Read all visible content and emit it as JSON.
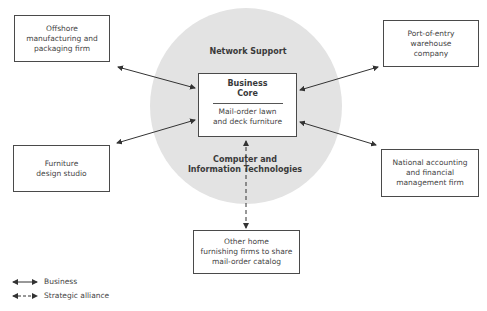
{
  "diagram": {
    "network_support_label": "Network Support",
    "core": {
      "title_line1": "Business",
      "title_line2": "Core",
      "subtitle_line1": "Mail-order lawn",
      "subtitle_line2": "and deck furniture"
    },
    "tech_label_line1": "Computer and",
    "tech_label_line2": "Information Technologies",
    "partners": [
      {
        "id": "offshore",
        "lines": [
          "Offshore",
          "manufacturing and",
          "packaging firm"
        ],
        "relationship": "business"
      },
      {
        "id": "port",
        "lines": [
          "Port-of-entry",
          "warehouse",
          "company"
        ],
        "relationship": "business"
      },
      {
        "id": "furniture-design",
        "lines": [
          "Furniture",
          "design studio"
        ],
        "relationship": "business"
      },
      {
        "id": "accounting",
        "lines": [
          "National accounting",
          "and financial",
          "management firm"
        ],
        "relationship": "business"
      },
      {
        "id": "home-furnishing",
        "lines": [
          "Other home",
          "furnishing firms to share",
          "mail-order catalog"
        ],
        "relationship": "strategic alliance"
      }
    ]
  },
  "legend": {
    "business_label": "Business",
    "alliance_label": "Strategic alliance"
  }
}
